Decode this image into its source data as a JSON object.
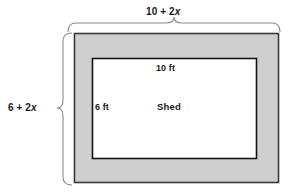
{
  "figure": {
    "type": "geometry-diagram",
    "outer_region": {
      "name": "border-region",
      "fill_color": "#cfcfcf",
      "stroke_color": "#333333"
    },
    "inner_region": {
      "name": "shed",
      "fill_color": "#ffffff",
      "stroke_color": "#111111"
    },
    "labels": {
      "outer_width": {
        "prefix": "10 + 2",
        "variable": "x",
        "full": "10 + 2x"
      },
      "outer_height": {
        "prefix": "6 + 2",
        "variable": "x",
        "full": "6 + 2x"
      },
      "inner_width": "10 ft",
      "inner_height": "6 ft",
      "shape_name": "Shed"
    },
    "braces": {
      "top": "width-brace",
      "left": "height-brace"
    }
  }
}
